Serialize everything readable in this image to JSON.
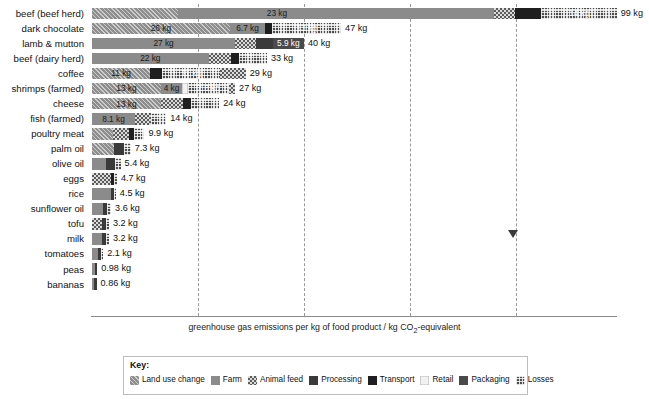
{
  "chart_data": {
    "type": "bar",
    "subtype": "horizontal-stacked",
    "title": "",
    "xlabel": "greenhouse gas emissions per kg of food product / kg CO₂-equivalent",
    "ylabel": "",
    "xlim": [
      0,
      105
    ],
    "grid": "vertical-dashed",
    "gridline_values": [
      20,
      40,
      60,
      80
    ],
    "legend_position": "bottom",
    "unit": "kg",
    "series": [
      {
        "name": "Land use change",
        "key": "landuse"
      },
      {
        "name": "Farm",
        "key": "farm"
      },
      {
        "name": "Animal feed",
        "key": "feed"
      },
      {
        "name": "Processing",
        "key": "processing"
      },
      {
        "name": "Transport",
        "key": "transport"
      },
      {
        "name": "Retail",
        "key": "retail"
      },
      {
        "name": "Packaging",
        "key": "packaging"
      },
      {
        "name": "Losses",
        "key": "losses"
      }
    ],
    "categories": [
      "beef (beef herd)",
      "dark chocolate",
      "lamb & mutton",
      "beef (dairy herd)",
      "coffee",
      "shrimps (farmed)",
      "cheese",
      "fish (farmed)",
      "poultry meat",
      "palm oil",
      "olive oil",
      "eggs",
      "rice",
      "sunflower oil",
      "tofu",
      "milk",
      "tomatoes",
      "peas",
      "bananas"
    ],
    "rows": [
      {
        "label": "beef (beef herd)",
        "total": 99,
        "total_label": "99 kg",
        "segments": [
          {
            "key": "landuse",
            "value": 16.3,
            "label": ""
          },
          {
            "key": "farm",
            "value": 59.6,
            "label": "23 kg",
            "label_pos": 0.28
          },
          {
            "key": "feed",
            "value": 4.0,
            "label": ""
          },
          {
            "key": "transport",
            "value": 4.9,
            "label": ""
          },
          {
            "key": "losses",
            "value": 14.2,
            "label": "14 kg"
          }
        ]
      },
      {
        "label": "dark chocolate",
        "total": 47,
        "total_label": "47 kg",
        "segments": [
          {
            "key": "landuse",
            "value": 26.0,
            "label": "26 kg"
          },
          {
            "key": "farm",
            "value": 6.7,
            "label": "6.7 kg"
          },
          {
            "key": "transport",
            "value": 1.3,
            "label": ""
          },
          {
            "key": "losses",
            "value": 13.0,
            "label": "13 kg"
          }
        ]
      },
      {
        "label": "lamb & mutton",
        "total": 40,
        "total_label": "40 kg",
        "segments": [
          {
            "key": "farm",
            "value": 27.0,
            "label": "27 kg"
          },
          {
            "key": "feed",
            "value": 4.0,
            "label": ""
          },
          {
            "key": "processing",
            "value": 3.1,
            "label": ""
          },
          {
            "key": "packaging",
            "value": 5.9,
            "label": "5.9 kg"
          }
        ]
      },
      {
        "label": "beef (dairy herd)",
        "total": 33,
        "total_label": "33 kg",
        "segments": [
          {
            "key": "farm",
            "value": 22.0,
            "label": "22 kg"
          },
          {
            "key": "feed",
            "value": 4.2,
            "label": ""
          },
          {
            "key": "transport",
            "value": 1.6,
            "label": ""
          },
          {
            "key": "losses",
            "value": 5.2,
            "label": ""
          }
        ]
      },
      {
        "label": "coffee",
        "total": 29,
        "total_label": "29 kg",
        "segments": [
          {
            "key": "landuse",
            "value": 11.0,
            "label": "11 kg"
          },
          {
            "key": "transport",
            "value": 2.2,
            "label": ""
          },
          {
            "key": "losses",
            "value": 11.0,
            "label": "11 kg"
          },
          {
            "key": "feed",
            "value": 4.8,
            "label": ""
          }
        ]
      },
      {
        "label": "shrimps (farmed)",
        "total": 27,
        "total_label": "27 kg",
        "segments": [
          {
            "key": "landuse",
            "value": 13.0,
            "label": "13 kg"
          },
          {
            "key": "farm",
            "value": 4.0,
            "label": "4 kg"
          },
          {
            "key": "retail",
            "value": 1.1,
            "label": ""
          },
          {
            "key": "losses",
            "value": 7.8,
            "label": "7.8 kg"
          },
          {
            "key": "feed",
            "value": 1.1,
            "label": ""
          }
        ]
      },
      {
        "label": "cheese",
        "total": 24,
        "total_label": "24 kg",
        "segments": [
          {
            "key": "landuse",
            "value": 13.0,
            "label": "13 kg"
          },
          {
            "key": "feed",
            "value": 4.2,
            "label": ""
          },
          {
            "key": "transport",
            "value": 1.4,
            "label": ""
          },
          {
            "key": "losses",
            "value": 5.4,
            "label": ""
          }
        ]
      },
      {
        "label": "fish (farmed)",
        "total": 14,
        "total_label": "14 kg",
        "segments": [
          {
            "key": "farm",
            "value": 8.1,
            "label": "8.1 kg"
          },
          {
            "key": "feed",
            "value": 3.1,
            "label": ""
          },
          {
            "key": "losses",
            "value": 2.8,
            "label": ""
          }
        ]
      },
      {
        "label": "poultry meat",
        "total": 9.9,
        "total_label": "9.9 kg",
        "segments": [
          {
            "key": "landuse",
            "value": 3.9,
            "label": ""
          },
          {
            "key": "feed",
            "value": 3.1,
            "label": ""
          },
          {
            "key": "transport",
            "value": 1.0,
            "label": ""
          },
          {
            "key": "losses",
            "value": 1.9,
            "label": ""
          }
        ]
      },
      {
        "label": "palm oil",
        "total": 7.3,
        "total_label": "7.3 kg",
        "segments": [
          {
            "key": "landuse",
            "value": 4.1,
            "label": ""
          },
          {
            "key": "processing",
            "value": 1.9,
            "label": ""
          },
          {
            "key": "losses",
            "value": 1.3,
            "label": ""
          }
        ]
      },
      {
        "label": "olive oil",
        "total": 5.4,
        "total_label": "5.4 kg",
        "segments": [
          {
            "key": "farm",
            "value": 2.6,
            "label": ""
          },
          {
            "key": "processing",
            "value": 1.7,
            "label": ""
          },
          {
            "key": "losses",
            "value": 1.1,
            "label": ""
          }
        ]
      },
      {
        "label": "eggs",
        "total": 4.7,
        "total_label": "4.7 kg",
        "segments": [
          {
            "key": "feed",
            "value": 3.5,
            "label": ""
          },
          {
            "key": "transport",
            "value": 0.6,
            "label": ""
          },
          {
            "key": "losses",
            "value": 0.6,
            "label": ""
          }
        ]
      },
      {
        "label": "rice",
        "total": 4.5,
        "total_label": "4.5 kg",
        "segments": [
          {
            "key": "farm",
            "value": 3.6,
            "label": ""
          },
          {
            "key": "processing",
            "value": 0.5,
            "label": ""
          },
          {
            "key": "losses",
            "value": 0.4,
            "label": ""
          }
        ]
      },
      {
        "label": "sunflower oil",
        "total": 3.6,
        "total_label": "3.6 kg",
        "segments": [
          {
            "key": "farm",
            "value": 2.0,
            "label": ""
          },
          {
            "key": "processing",
            "value": 0.9,
            "label": ""
          },
          {
            "key": "losses",
            "value": 0.7,
            "label": ""
          }
        ]
      },
      {
        "label": "tofu",
        "total": 3.2,
        "total_label": "3.2 kg",
        "segments": [
          {
            "key": "feed",
            "value": 1.8,
            "label": ""
          },
          {
            "key": "processing",
            "value": 0.8,
            "label": ""
          },
          {
            "key": "losses",
            "value": 0.6,
            "label": ""
          }
        ]
      },
      {
        "label": "milk",
        "total": 3.2,
        "total_label": "3.2 kg",
        "segments": [
          {
            "key": "farm",
            "value": 1.9,
            "label": ""
          },
          {
            "key": "processing",
            "value": 0.7,
            "label": ""
          },
          {
            "key": "losses",
            "value": 0.6,
            "label": ""
          }
        ]
      },
      {
        "label": "tomatoes",
        "total": 2.1,
        "total_label": "2.1 kg",
        "segments": [
          {
            "key": "farm",
            "value": 1.1,
            "label": ""
          },
          {
            "key": "processing",
            "value": 0.6,
            "label": ""
          },
          {
            "key": "losses",
            "value": 0.4,
            "label": ""
          }
        ]
      },
      {
        "label": "peas",
        "total": 0.98,
        "total_label": "0.98 kg",
        "segments": [
          {
            "key": "farm",
            "value": 0.55,
            "label": ""
          },
          {
            "key": "processing",
            "value": 0.43,
            "label": ""
          }
        ]
      },
      {
        "label": "bananas",
        "total": 0.86,
        "total_label": "0.86 kg",
        "segments": [
          {
            "key": "farm",
            "value": 0.45,
            "label": ""
          },
          {
            "key": "processing",
            "value": 0.41,
            "label": ""
          }
        ]
      }
    ],
    "annotation_marker": {
      "x_value": 79.5,
      "row_index": 15,
      "shape": "down-triangle"
    }
  },
  "key": {
    "title": "Key:",
    "items": [
      {
        "label": "Land use change",
        "key": "landuse"
      },
      {
        "label": "Farm",
        "key": "farm"
      },
      {
        "label": "Animal feed",
        "key": "feed"
      },
      {
        "label": "Processing",
        "key": "processing"
      },
      {
        "label": "Transport",
        "key": "transport"
      },
      {
        "label": "Retail",
        "key": "retail"
      },
      {
        "label": "Packaging",
        "key": "packaging"
      },
      {
        "label": "Losses",
        "key": "losses"
      }
    ]
  },
  "colors": {
    "landuse": "#8e8e8e",
    "farm": "#8b8b8b",
    "feed": "#5b5b5b",
    "processing": "#3a3a3a",
    "transport": "#1f1f1f",
    "retail": "#f2f2f2",
    "packaging": "#4a4a4a",
    "losses": "#4e4e4e",
    "axis": "#8a8a8a",
    "gridline": "#9a9a9a",
    "text": "#111111"
  }
}
